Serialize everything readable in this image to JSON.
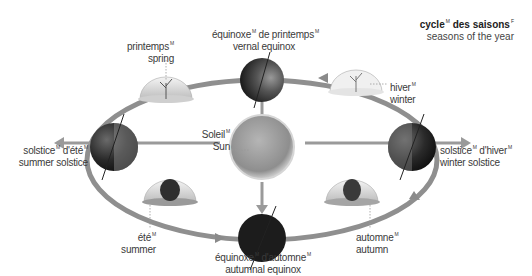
{
  "title": {
    "fr": "cycle",
    "fr_gender": "M",
    "fr2": "des saisons",
    "fr2_gender": "F",
    "en": "seasons of the year"
  },
  "labels": {
    "vernal_equinox": {
      "fr_a": "équinoxe",
      "g_a": "M",
      "fr_b": "de printemps",
      "g_b": "M",
      "en": "vernal equinox"
    },
    "spring": {
      "fr": "printemps",
      "g": "M",
      "en": "spring"
    },
    "winter": {
      "fr": "hiver",
      "g": "M",
      "en": "winter"
    },
    "summer_solstice": {
      "fr_a": "solstice",
      "g_a": "M",
      "fr_b": "d'été",
      "g_b": "M",
      "en": "summer solstice"
    },
    "sun": {
      "fr": "Soleil",
      "g": "M",
      "en": "Sun"
    },
    "winter_solstice": {
      "fr_a": "solstice",
      "g_a": "M",
      "fr_b": "d'hiver",
      "g_b": "M",
      "en": "winter solstice"
    },
    "summer": {
      "fr": "été",
      "g": "M",
      "en": "summer"
    },
    "autumnal_equinox": {
      "fr_a": "équinoxe",
      "g_a": "M",
      "fr_b": "d'automne",
      "g_b": "M",
      "en": "autumnal equinox"
    },
    "autumn": {
      "fr": "automne",
      "g": "M",
      "en": "autumn"
    }
  },
  "colors": {
    "orbit": "#8a8a8a",
    "earth_dark": "#1a1a1a",
    "sun": "#9a9a9a",
    "dome": "#d8d8d8",
    "text": "#3a3a3a"
  }
}
